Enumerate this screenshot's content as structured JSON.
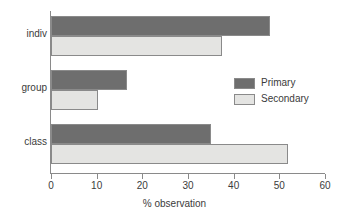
{
  "chart_data": {
    "type": "bar",
    "orientation": "horizontal",
    "title": "",
    "xlabel": "% observation",
    "ylabel": "",
    "categories": [
      "indiv",
      "group",
      "class"
    ],
    "series": [
      {
        "name": "Primary",
        "color": "#6e6e6e",
        "values": [
          48,
          16.6,
          35
        ]
      },
      {
        "name": "Secondary",
        "color": "#e4e4e2",
        "values": [
          37.4,
          10.3,
          52
        ]
      }
    ],
    "xlim": [
      0,
      60
    ],
    "xticks": [
      0,
      10,
      20,
      30,
      40,
      50,
      60
    ],
    "xtick_labels": [
      "0",
      "10",
      "20",
      "30",
      "40",
      "50",
      "60"
    ],
    "grid": false,
    "legend": {
      "position": "upper-right-inside",
      "entries": [
        {
          "label": "Primary",
          "color": "#6e6e6e"
        },
        {
          "label": "Secondary",
          "color": "#e4e4e2"
        }
      ]
    },
    "axis_color": "#8a8a8a",
    "background": "#ffffff"
  }
}
